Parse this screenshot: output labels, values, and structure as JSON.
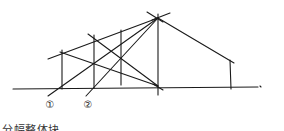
{
  "diagram": {
    "caption": "分幅整体块",
    "labels": [
      {
        "text": "①",
        "x": 50,
        "y": 108
      },
      {
        "text": "②",
        "x": 88,
        "y": 108
      }
    ],
    "lines": [
      {
        "name": "ground-line",
        "x1": 13,
        "y1": 89,
        "x2": 258,
        "y2": 87
      },
      {
        "name": "ground-tick",
        "x1": 260,
        "y1": 86,
        "x2": 261,
        "y2": 87
      },
      {
        "name": "apex-vertical",
        "x1": 158,
        "y1": 14,
        "x2": 158,
        "y2": 95
      },
      {
        "name": "apex-cross-a",
        "x1": 147,
        "y1": 12,
        "x2": 163,
        "y2": 22
      },
      {
        "name": "apex-cross-b",
        "x1": 152,
        "y1": 20,
        "x2": 170,
        "y2": 13
      },
      {
        "name": "right-slope",
        "x1": 158,
        "y1": 18,
        "x2": 234,
        "y2": 63
      },
      {
        "name": "right-vertical",
        "x1": 230,
        "y1": 60,
        "x2": 231,
        "y2": 89
      },
      {
        "name": "roof-line-upper",
        "x1": 48,
        "y1": 59,
        "x2": 158,
        "y2": 18
      },
      {
        "name": "vertical-1",
        "x1": 62,
        "y1": 50,
        "x2": 62,
        "y2": 89
      },
      {
        "name": "vertical-2",
        "x1": 94,
        "y1": 35,
        "x2": 94,
        "y2": 88
      },
      {
        "name": "vertical-3",
        "x1": 121,
        "y1": 30,
        "x2": 121,
        "y2": 85
      },
      {
        "name": "diag-2-to-ground",
        "x1": 88,
        "y1": 34,
        "x2": 158,
        "y2": 86
      },
      {
        "name": "diag-1-to-ground",
        "x1": 60,
        "y1": 52,
        "x2": 158,
        "y2": 86
      },
      {
        "name": "ray-1-to-apex",
        "x1": 48,
        "y1": 96,
        "x2": 158,
        "y2": 18
      },
      {
        "name": "ray-2-to-apex",
        "x1": 86,
        "y1": 96,
        "x2": 158,
        "y2": 18
      },
      {
        "name": "ground-cross",
        "x1": 153,
        "y1": 84,
        "x2": 163,
        "y2": 90
      }
    ]
  }
}
